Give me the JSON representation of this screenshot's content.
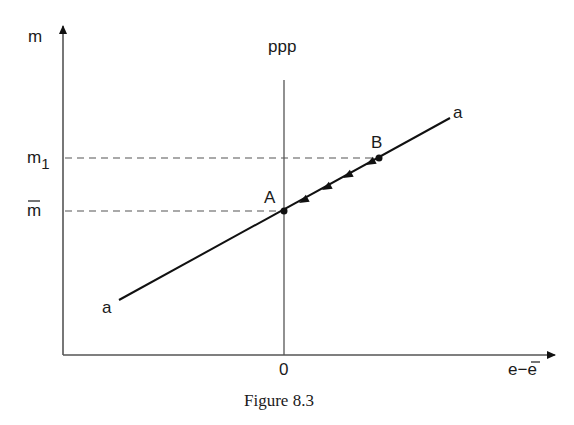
{
  "figure": {
    "caption": "Figure 8.3",
    "y_axis_label": "m",
    "x_axis_label": "e−e̅",
    "x_label_main": "e−e",
    "vertical_line_label": "ppp",
    "origin_label": "0",
    "y_ticks": [
      {
        "label": "m",
        "sub": "1",
        "id": "m1"
      },
      {
        "label": "m",
        "overbar": true,
        "id": "mbar"
      }
    ],
    "line_label_start": "a",
    "line_label_end": "a",
    "points": [
      {
        "label": "A",
        "desc": "equilibrium at e - e̅ = 0, m = m̅"
      },
      {
        "label": "B",
        "desc": "point at m = m1 on line aa"
      }
    ],
    "arrows_direction": "from B toward A along aa",
    "arrow_count": 4
  }
}
